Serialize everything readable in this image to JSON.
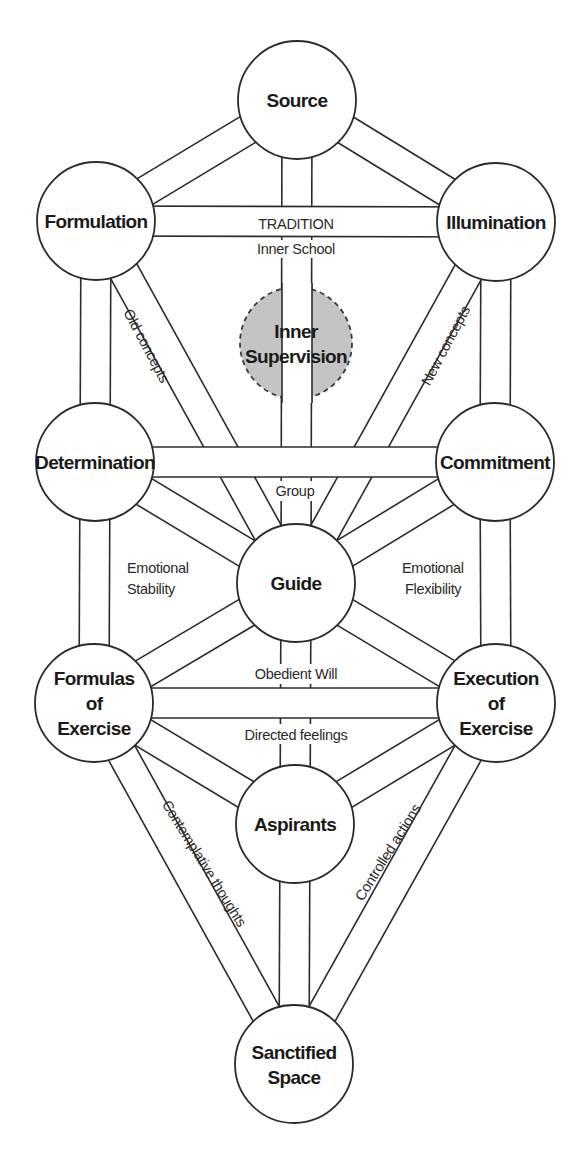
{
  "diagram": {
    "colors": {
      "line": "#2b2b2b",
      "hidden_node_fill": "#c4c4c4",
      "background": "#ffffff"
    },
    "nodes": [
      {
        "id": "source",
        "lines": [
          "Source"
        ],
        "style": "solid"
      },
      {
        "id": "formulation",
        "lines": [
          "Formulation"
        ],
        "style": "solid"
      },
      {
        "id": "illumination",
        "lines": [
          "Illumination"
        ],
        "style": "solid"
      },
      {
        "id": "inner-supervision",
        "lines": [
          "Inner",
          "Supervision"
        ],
        "style": "dashed"
      },
      {
        "id": "determination",
        "lines": [
          "Determination"
        ],
        "style": "solid"
      },
      {
        "id": "commitment",
        "lines": [
          "Commitment"
        ],
        "style": "solid"
      },
      {
        "id": "guide",
        "lines": [
          "Guide"
        ],
        "style": "solid"
      },
      {
        "id": "formulas-of-exercise",
        "lines": [
          "Formulas",
          "of",
          "Exercise"
        ],
        "style": "solid"
      },
      {
        "id": "execution-of-exercise",
        "lines": [
          "Execution",
          "of",
          "Exercise"
        ],
        "style": "solid"
      },
      {
        "id": "aspirants",
        "lines": [
          "Aspirants"
        ],
        "style": "solid"
      },
      {
        "id": "sanctified-space",
        "lines": [
          "Sanctified",
          "Space"
        ],
        "style": "solid"
      }
    ],
    "edges": [
      {
        "from": "source",
        "to": "formulation"
      },
      {
        "from": "source",
        "to": "illumination"
      },
      {
        "from": "source",
        "to": "guide"
      },
      {
        "from": "formulation",
        "to": "illumination"
      },
      {
        "from": "formulation",
        "to": "determination"
      },
      {
        "from": "formulation",
        "to": "guide"
      },
      {
        "from": "illumination",
        "to": "commitment"
      },
      {
        "from": "illumination",
        "to": "guide"
      },
      {
        "from": "determination",
        "to": "commitment"
      },
      {
        "from": "determination",
        "to": "guide"
      },
      {
        "from": "commitment",
        "to": "guide"
      },
      {
        "from": "determination",
        "to": "formulas-of-exercise"
      },
      {
        "from": "commitment",
        "to": "execution-of-exercise"
      },
      {
        "from": "guide",
        "to": "formulas-of-exercise"
      },
      {
        "from": "guide",
        "to": "execution-of-exercise"
      },
      {
        "from": "guide",
        "to": "aspirants"
      },
      {
        "from": "formulas-of-exercise",
        "to": "execution-of-exercise"
      },
      {
        "from": "formulas-of-exercise",
        "to": "aspirants"
      },
      {
        "from": "execution-of-exercise",
        "to": "aspirants"
      },
      {
        "from": "formulas-of-exercise",
        "to": "sanctified-space"
      },
      {
        "from": "execution-of-exercise",
        "to": "sanctified-space"
      },
      {
        "from": "aspirants",
        "to": "sanctified-space"
      }
    ],
    "path_labels": {
      "tradition": "TRADITION",
      "inner_school": "Inner School",
      "old_concepts": "Old concepts",
      "new_concepts": "New concepts",
      "group": "Group",
      "emotional_stability": [
        "Emotional",
        "Stability"
      ],
      "emotional_flexibility": [
        "Emotional",
        "Flexibility"
      ],
      "obedient_will": "Obedient Will",
      "directed_feelings": "Directed feelings",
      "contemplative_thoughts": "Contemplative thoughts",
      "controlled_actions": "Controlled actions"
    }
  }
}
